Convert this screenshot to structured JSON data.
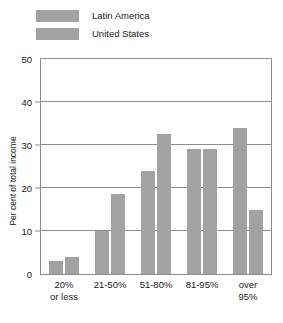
{
  "chart_data": {
    "type": "bar",
    "title": "",
    "xlabel": "",
    "ylabel": "Per cent of total income",
    "ylim": [
      0,
      50
    ],
    "yticks": [
      0,
      10,
      20,
      30,
      40,
      50
    ],
    "grid": true,
    "legend_position": "top-left",
    "categories": [
      "20%\nor less",
      "21-50%",
      "51-80%",
      "81-95%",
      "over\n95%"
    ],
    "category_lines": [
      [
        "20%",
        "or less"
      ],
      [
        "21-50%",
        ""
      ],
      [
        "51-80%",
        ""
      ],
      [
        "81-95%",
        ""
      ],
      [
        "over",
        "95%"
      ]
    ],
    "series": [
      {
        "name": "Latin America",
        "values": [
          3,
          10,
          24,
          29,
          34
        ],
        "color": "#a2a2a2"
      },
      {
        "name": "United States",
        "values": [
          4,
          18.7,
          32.5,
          29,
          15
        ],
        "color": "#a2a2a2"
      }
    ]
  },
  "legend": {
    "items": [
      {
        "label": "Latin America",
        "color": "#a2a2a2"
      },
      {
        "label": "United States",
        "color": "#a2a2a2"
      }
    ]
  },
  "axis": {
    "y_title": "Per cent of total income",
    "y_tick_labels": [
      "50",
      "40",
      "30",
      "20",
      "10",
      "0"
    ]
  },
  "colors": {
    "bar": "#a2a2a2",
    "axis": "#8e8e8e",
    "text": "#1a1a1a",
    "background": "#ffffff"
  }
}
